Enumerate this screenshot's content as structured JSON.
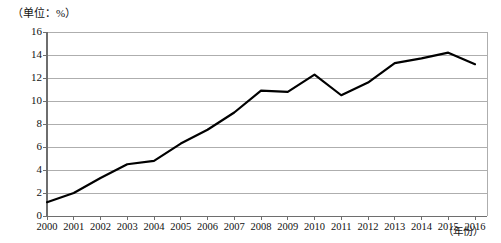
{
  "chart_data": {
    "type": "line",
    "title": "",
    "unit_note": "（单位：%）",
    "xlabel": "（年份）",
    "ylabel": "",
    "categories": [
      "2000",
      "2001",
      "2002",
      "2003",
      "2004",
      "2005",
      "2006",
      "2007",
      "2008",
      "2009",
      "2010",
      "2011",
      "2012",
      "2013",
      "2014",
      "2015",
      "2016"
    ],
    "values": [
      1.2,
      2.0,
      3.3,
      4.5,
      4.8,
      6.3,
      7.5,
      9.0,
      10.9,
      10.8,
      12.3,
      10.5,
      11.6,
      13.3,
      13.7,
      14.2,
      13.2
    ],
    "ylim": [
      0,
      16
    ],
    "yticks": [
      0,
      2,
      4,
      6,
      8,
      10,
      12,
      14,
      16
    ],
    "ytick_labels": [
      "0",
      "2",
      "4",
      "6",
      "8",
      "10",
      "12",
      "14",
      "16"
    ],
    "grid": true,
    "grid_axis": "y",
    "legend": false,
    "legend_position": "none",
    "series_color": "#000000",
    "grid_color": "#9a9a9a",
    "axis_color": "#6e6e6e",
    "background": "#ffffff",
    "markers": false,
    "line_width": 2.2
  },
  "axis": {
    "unit_note": "（单位：%）",
    "xlabel": "（年份）"
  }
}
